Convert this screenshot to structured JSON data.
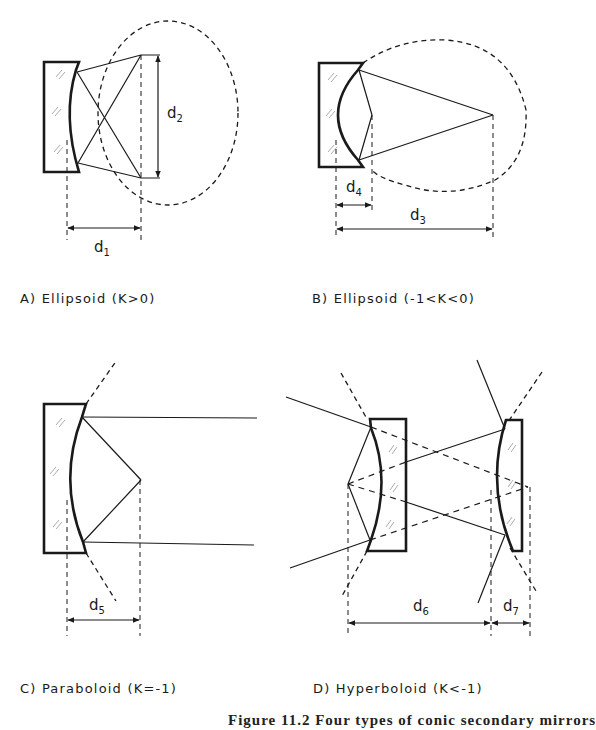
{
  "figure": {
    "caption": "Figure 11.2   Four types of conic secondary mirrors",
    "panels": [
      {
        "id": "A",
        "label": "A) Ellipsoid (K>0)",
        "dimensions": [
          {
            "base": "d",
            "sub": "1"
          },
          {
            "base": "d",
            "sub": "2"
          }
        ]
      },
      {
        "id": "B",
        "label": "B) Ellipsoid (-1<K<0)",
        "dimensions": [
          {
            "base": "d",
            "sub": "3"
          },
          {
            "base": "d",
            "sub": "4"
          }
        ]
      },
      {
        "id": "C",
        "label": "C) Paraboloid (K=-1)",
        "dimensions": [
          {
            "base": "d",
            "sub": "5"
          }
        ]
      },
      {
        "id": "D",
        "label": "D) Hyperboloid (K<-1)",
        "dimensions": [
          {
            "base": "d",
            "sub": "6"
          },
          {
            "base": "d",
            "sub": "7"
          }
        ]
      }
    ],
    "colors": {
      "line": "#1a1a1a",
      "background": "#ffffff"
    }
  }
}
